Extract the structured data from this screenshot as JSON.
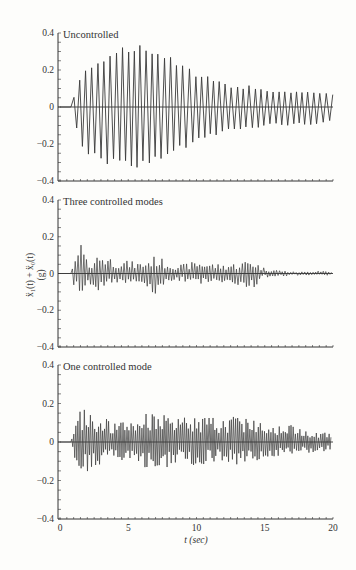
{
  "figure": {
    "ylabel_line1": "ẍ₁(t) + ẍ₀(t)",
    "ylabel_line2": "(g)",
    "xlabel": "t (sec)"
  },
  "colors": {
    "trace": "#3a3a3a",
    "axis": "#333333",
    "background": "#fdfdfb"
  },
  "chart_data": [
    {
      "type": "line",
      "title": "Uncontrolled",
      "xlabel": "t (sec)",
      "ylabel": "ẍ₁(t) + ẍ₀(t) (g)",
      "xlim": [
        0,
        20
      ],
      "ylim": [
        -0.4,
        0.4
      ],
      "yticks": [
        -0.4,
        -0.2,
        0,
        0.2,
        0.4
      ],
      "ytick_labels": [
        "−0.4",
        "−0.2",
        "0",
        "0.2",
        "0.4"
      ],
      "grid": false,
      "envelope": {
        "t": [
          0,
          0.8,
          1.0,
          1.5,
          2.0,
          3.0,
          4.0,
          5.0,
          6.0,
          7.0,
          8.0,
          9.0,
          10.0,
          11.0,
          12.0,
          13.0,
          14.0,
          15.0,
          16.0,
          17.0,
          18.0,
          19.0,
          19.8
        ],
        "peak_pos": [
          0,
          0.02,
          0.05,
          0.17,
          0.23,
          0.28,
          0.31,
          0.33,
          0.34,
          0.32,
          0.28,
          0.23,
          0.19,
          0.16,
          0.13,
          0.11,
          0.12,
          0.1,
          0.09,
          0.08,
          0.09,
          0.08,
          0.07
        ],
        "peak_neg": [
          0,
          -0.03,
          -0.07,
          -0.2,
          -0.26,
          -0.3,
          -0.32,
          -0.33,
          -0.33,
          -0.31,
          -0.27,
          -0.23,
          -0.19,
          -0.16,
          -0.14,
          -0.12,
          -0.13,
          -0.11,
          -0.1,
          -0.1,
          -0.1,
          -0.09,
          -0.08
        ]
      },
      "dominant_period_sec": 0.45
    },
    {
      "type": "line",
      "title": "Three controlled modes",
      "xlabel": "t (sec)",
      "ylabel": "ẍ₁(t) + ẍ₀(t) (g)",
      "xlim": [
        0,
        20
      ],
      "ylim": [
        -0.4,
        0.4
      ],
      "yticks": [
        -0.4,
        -0.2,
        0,
        0.2,
        0.4
      ],
      "ytick_labels": [
        "−0.4",
        "−0.2",
        "0",
        "0.2",
        "0.4"
      ],
      "grid": false,
      "envelope": {
        "t": [
          0,
          0.8,
          1.0,
          1.5,
          2.0,
          3.0,
          4.0,
          5.0,
          6.0,
          7.0,
          8.0,
          9.0,
          10.0,
          11.0,
          12.0,
          13.0,
          14.0,
          15.0,
          16.0,
          17.0,
          18.0,
          19.0,
          19.8
        ],
        "peak_pos": [
          0,
          0.01,
          0.04,
          0.19,
          0.06,
          0.12,
          0.08,
          0.07,
          0.06,
          0.1,
          0.06,
          0.05,
          0.07,
          0.06,
          0.05,
          0.06,
          0.08,
          0.03,
          0.02,
          0.01,
          0.01,
          0.02,
          0.01
        ],
        "peak_neg": [
          0,
          -0.01,
          -0.06,
          -0.17,
          -0.08,
          -0.1,
          -0.06,
          -0.05,
          -0.06,
          -0.12,
          -0.05,
          -0.05,
          -0.06,
          -0.05,
          -0.06,
          -0.07,
          -0.09,
          -0.02,
          -0.02,
          -0.01,
          -0.01,
          -0.01,
          -0.01
        ]
      },
      "dominant_period_sec": 0.2
    },
    {
      "type": "line",
      "title": "One controlled mode",
      "xlabel": "t (sec)",
      "ylabel": "ẍ₁(t) + ẍ₀(t) (g)",
      "xlim": [
        0,
        20
      ],
      "ylim": [
        -0.4,
        0.4
      ],
      "xticks": [
        0,
        5,
        10,
        15,
        20
      ],
      "xtick_labels": [
        "0",
        "5",
        "10",
        "15",
        "20"
      ],
      "yticks": [
        -0.4,
        -0.2,
        0,
        0.2,
        0.4
      ],
      "ytick_labels": [
        "−0.4",
        "−0.2",
        "0",
        "0.2",
        "0.4"
      ],
      "grid": false,
      "envelope": {
        "t": [
          0,
          0.8,
          1.0,
          1.5,
          2.0,
          3.0,
          4.0,
          5.0,
          6.0,
          7.0,
          8.0,
          9.0,
          10.0,
          11.0,
          12.0,
          13.0,
          14.0,
          15.0,
          16.0,
          17.0,
          18.0,
          19.0,
          19.8
        ],
        "peak_pos": [
          0,
          0.01,
          0.05,
          0.18,
          0.16,
          0.14,
          0.1,
          0.11,
          0.14,
          0.18,
          0.12,
          0.13,
          0.14,
          0.13,
          0.12,
          0.15,
          0.13,
          0.11,
          0.1,
          0.09,
          0.07,
          0.06,
          0.05
        ],
        "peak_neg": [
          0,
          -0.01,
          -0.08,
          -0.17,
          -0.16,
          -0.12,
          -0.09,
          -0.1,
          -0.12,
          -0.19,
          -0.12,
          -0.11,
          -0.13,
          -0.11,
          -0.1,
          -0.12,
          -0.11,
          -0.09,
          -0.08,
          -0.07,
          -0.06,
          -0.05,
          -0.05
        ]
      },
      "dominant_period_sec": 0.15
    }
  ],
  "panels": [
    {
      "title": "Uncontrolled",
      "top": 33,
      "bottom": 181
    },
    {
      "title": "Three controlled modes",
      "top": 200,
      "bottom": 347
    },
    {
      "title": "One controlled mode",
      "top": 365,
      "bottom": 519
    }
  ],
  "axes": {
    "x_left_px": 60,
    "x_right_px": 333,
    "ytick_labels": [
      "0.4",
      "0.2",
      "0",
      "−0.2",
      "−0.4"
    ],
    "xtick_labels": [
      "0",
      "5",
      "10",
      "15",
      "20"
    ]
  }
}
